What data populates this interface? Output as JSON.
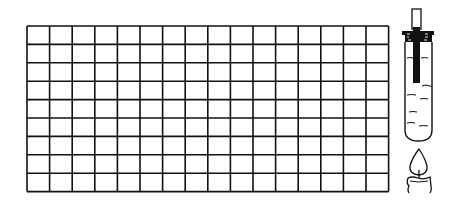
{
  "figure": {
    "colors": {
      "line": "#111111",
      "background": "#ffffff"
    }
  },
  "grid": {
    "columns": 16,
    "rows": 9,
    "x": 27,
    "y": 26,
    "cell_width": 22.6,
    "cell_height": 18.4,
    "line_width": 1.6
  },
  "apparatus": {
    "test_tube": {
      "label": "test-tube",
      "contents": "liquid"
    },
    "stopper": {
      "label": "stopper"
    },
    "thermometer_rod": {
      "label": "rod"
    },
    "candle": {
      "label": "candle",
      "flame": "lit"
    }
  }
}
